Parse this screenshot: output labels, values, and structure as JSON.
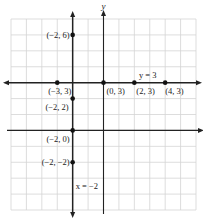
{
  "chart_data": {
    "type": "scatter",
    "title": "",
    "xlabel": "x",
    "ylabel": "y",
    "xlim": [
      -6,
      6
    ],
    "ylim": [
      -5,
      7
    ],
    "grid": true,
    "lines": [
      {
        "name": "horizontal-line",
        "equation": "y = 3",
        "label": "y = 3",
        "kind": "horizontal",
        "value": 3
      },
      {
        "name": "vertical-line",
        "equation": "x = -2",
        "label": "x = −2",
        "kind": "vertical",
        "value": -2
      }
    ],
    "points": [
      {
        "x": -2,
        "y": 6,
        "label": "(−2, 6)"
      },
      {
        "x": -3,
        "y": 3,
        "label": "(−3, 3)"
      },
      {
        "x": 0,
        "y": 3,
        "label": "(0, 3)"
      },
      {
        "x": 2,
        "y": 3,
        "label": "(2, 3)"
      },
      {
        "x": 4,
        "y": 3,
        "label": "(4, 3)"
      },
      {
        "x": -2,
        "y": 2,
        "label": "(−2, 2)"
      },
      {
        "x": -2,
        "y": 0,
        "label": "(−2, 0)"
      },
      {
        "x": -2,
        "y": -2,
        "label": "(−2, −2)"
      }
    ]
  }
}
